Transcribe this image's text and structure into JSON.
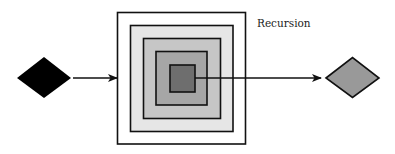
{
  "diagram": {
    "label": "Recursion",
    "input_node": {
      "shape": "diamond",
      "fill": "#000000"
    },
    "output_node": {
      "shape": "diamond",
      "fill": "#999999"
    },
    "nested_squares": [
      {
        "level": 1,
        "fill": "#ffffff"
      },
      {
        "level": 2,
        "fill": "#e6e6e6"
      },
      {
        "level": 3,
        "fill": "#c6c6c6"
      },
      {
        "level": 4,
        "fill": "#a6a6a6"
      },
      {
        "level": 5,
        "fill": "#6e6e6e"
      }
    ],
    "edges": [
      {
        "from": "input_node",
        "to": "nested_squares"
      },
      {
        "from": "innermost_square",
        "to": "output_node"
      }
    ]
  }
}
